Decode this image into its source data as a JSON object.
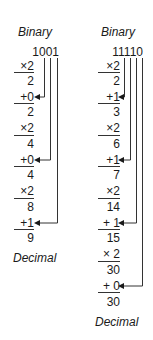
{
  "left": {
    "header": "Binary",
    "binary": "1001",
    "footer": "Decimal",
    "steps": [
      {
        "op": "×2",
        "result": "2",
        "op_y": 60,
        "res_y": 74,
        "rule_y": 72
      },
      {
        "op": "+0",
        "result": "2",
        "op_y": 91,
        "res_y": 106,
        "rule_y": 103
      },
      {
        "op": "×2",
        "result": "4",
        "op_y": 122,
        "res_y": 137,
        "rule_y": 135
      },
      {
        "op": "+0",
        "result": "4",
        "op_y": 154,
        "res_y": 169,
        "rule_y": 166
      },
      {
        "op": "×2",
        "result": "8",
        "op_y": 185,
        "res_y": 201,
        "rule_y": 198
      },
      {
        "op": "+1",
        "result": "9",
        "op_y": 217,
        "res_y": 232,
        "rule_y": 229
      }
    ]
  },
  "right": {
    "header": "Binary",
    "binary": "11110",
    "footer": "Decimal",
    "steps": [
      {
        "op": "×2",
        "result": "2",
        "op_y": 60,
        "res_y": 74,
        "rule_y": 72
      },
      {
        "op": "+1",
        "result": "3",
        "op_y": 91,
        "res_y": 106,
        "rule_y": 103
      },
      {
        "op": "×2",
        "result": "6",
        "op_y": 122,
        "res_y": 137,
        "rule_y": 135
      },
      {
        "op": "+1",
        "result": "7",
        "op_y": 154,
        "res_y": 169,
        "rule_y": 166
      },
      {
        "op": "×2",
        "result": "14",
        "op_y": 185,
        "res_y": 201,
        "rule_y": 198
      },
      {
        "op": "+ 1",
        "result": "15",
        "op_y": 217,
        "res_y": 232,
        "rule_y": 229
      },
      {
        "op": "× 2",
        "result": "30",
        "op_y": 248,
        "res_y": 264,
        "rule_y": 261
      },
      {
        "op": "+ 0",
        "result": "30",
        "op_y": 280,
        "res_y": 296,
        "rule_y": 292
      }
    ]
  },
  "colors": {
    "ink": "#1a1a1a",
    "background": "#ffffff"
  }
}
